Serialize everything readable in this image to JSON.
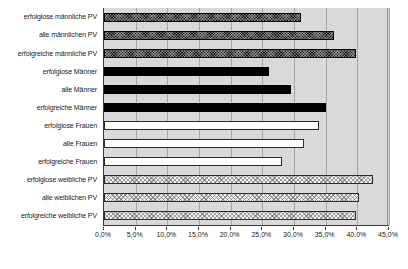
{
  "chart_data": {
    "type": "bar",
    "orientation": "horizontal",
    "title": "",
    "xlabel": "",
    "ylabel": "",
    "xlim": [
      0,
      45
    ],
    "xtick_labels": [
      "0,0%",
      "5,0%",
      "10,0%",
      "15,0%",
      "20,0%",
      "25,0%",
      "30,0%",
      "35,0%",
      "40,0%",
      "45,0%"
    ],
    "xticks": [
      0,
      5,
      10,
      15,
      20,
      25,
      30,
      35,
      40,
      45
    ],
    "grid": true,
    "legend": "none",
    "plot_background": "#d9d9d9",
    "categories": [
      "erfolglose männliche PV",
      "alle männlichen PV",
      "erfolgreiche männliche PV",
      "erfolglose Männer",
      "alle Männer",
      "erfolgreiche Männer",
      "erfolglose Frauen",
      "alle Frauen",
      "erfolgreiche Frauen",
      "erfolglose weibliche PV",
      "alle weiblichen PV",
      "erfolgreiche weibliche PV"
    ],
    "values": [
      31.1,
      36.3,
      39.8,
      26.1,
      29.5,
      35.1,
      34.0,
      31.6,
      28.1,
      42.5,
      40.2,
      39.8
    ],
    "bar_styles": [
      "styleA",
      "styleA",
      "styleA",
      "styleB",
      "styleB",
      "styleB",
      "styleC",
      "styleC",
      "styleC",
      "styleD",
      "styleD",
      "styleD"
    ],
    "style_colors": {
      "styleA": "#171717",
      "styleB": "#000000",
      "styleC": "#ffffff",
      "styleD": "#f2f2f2"
    }
  }
}
